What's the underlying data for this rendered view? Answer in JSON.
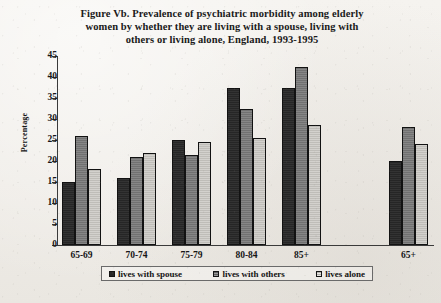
{
  "chart_data": {
    "type": "bar",
    "title": "Figure Vb.  Prevalence of psychiatric morbidity among elderly women by whether they are living with a spouse, living with others or living alone, England, 1993-1995",
    "title_lines": [
      "Figure Vb.  Prevalence of psychiatric morbidity among elderly",
      "women by whether they are living with a spouse, living with",
      "others or living alone, England, 1993-1995"
    ],
    "xlabel": "",
    "ylabel": "Percentage",
    "ylim": [
      0,
      45
    ],
    "ytick_labels": [
      "0",
      "5",
      "10",
      "15",
      "20",
      "25",
      "30",
      "35",
      "40",
      "45"
    ],
    "ytick_values": [
      0,
      5,
      10,
      15,
      20,
      25,
      30,
      35,
      40,
      45
    ],
    "grid": false,
    "legend_position": "bottom",
    "categories": [
      "65-69",
      "70-74",
      "75-79",
      "80-84",
      "85+",
      "65+"
    ],
    "series": [
      {
        "name": "lives with spouse",
        "color": "#282828",
        "values": [
          15,
          16,
          25,
          37.5,
          37.5,
          20
        ]
      },
      {
        "name": "lives with others",
        "color": "#787878",
        "values": [
          26,
          21,
          21.5,
          32.5,
          42.5,
          28
        ]
      },
      {
        "name": "lives alone",
        "color": "#c9c7c2",
        "values": [
          18,
          22,
          24.5,
          25.5,
          28.5,
          24
        ]
      }
    ]
  },
  "legend": {
    "items": [
      {
        "label": "lives with spouse"
      },
      {
        "label": "lives with others"
      },
      {
        "label": "lives alone"
      }
    ]
  }
}
